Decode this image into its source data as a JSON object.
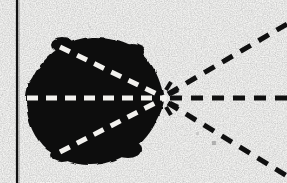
{
  "figure": {
    "kind": "scanned-line-drawing",
    "title": "Black blob with converging dashed axes and radiating dashed rays",
    "width": 287,
    "height": 183,
    "background_color": "#f7f7f5",
    "ink_color": "#0d0d0d",
    "dash_light_color": "#f2f1ee",
    "media": "photocopy / halftone scan",
    "noise": "light gray speckle on background"
  },
  "border_rule": {
    "name": "left vertical rule",
    "orientation": "vertical",
    "x": 17,
    "y_start": 0,
    "y_end": 183,
    "thickness": 2.2,
    "color": "#111111"
  },
  "blob": {
    "name": "solid black ovoid region",
    "fill_color": "#0d0d0d",
    "center_x": 92,
    "center_y": 100,
    "radius_x": 66,
    "radius_y": 63,
    "left_edge_x": 27,
    "right_tip_x": 166,
    "top_edge_y": 38,
    "bottom_edge_y": 165,
    "shape": "irregular ovoid, pointed at right vertex"
  },
  "vertex": {
    "name": "convergence point",
    "x": 164,
    "y": 98,
    "label": ""
  },
  "interior_dashes": {
    "color": "#f2f1ee",
    "dash_pattern": "11 8",
    "stroke_width": 5,
    "lines": [
      {
        "name": "interior-axis-upper",
        "x1": 60,
        "y1": 47,
        "x2": 163,
        "y2": 97
      },
      {
        "name": "interior-axis-middle",
        "x1": 27,
        "y1": 98,
        "x2": 163,
        "y2": 98
      },
      {
        "name": "interior-axis-lower",
        "x1": 60,
        "y1": 152,
        "x2": 163,
        "y2": 99
      }
    ]
  },
  "exterior_rays": {
    "color": "#101010",
    "dash_pattern": "12 9",
    "stroke_width": 5,
    "rays": [
      {
        "name": "ray-upper-right",
        "x1": 168,
        "y1": 94,
        "x2": 287,
        "y2": 24,
        "direction": "up-right"
      },
      {
        "name": "ray-horizontal-right",
        "x1": 170,
        "y1": 98,
        "x2": 287,
        "y2": 98,
        "direction": "right"
      },
      {
        "name": "ray-lower-right",
        "x1": 168,
        "y1": 103,
        "x2": 287,
        "y2": 176,
        "direction": "down-right"
      }
    ]
  },
  "vertex_ticks": {
    "name": "short radial ticks at vertex",
    "color": "#101010",
    "count": 4,
    "items": [
      {
        "name": "tick-up",
        "x1": 166,
        "y1": 90,
        "x2": 171,
        "y2": 82
      },
      {
        "name": "tick-up-inner",
        "x1": 170,
        "y1": 94,
        "x2": 178,
        "y2": 90
      },
      {
        "name": "tick-down-inner",
        "x1": 170,
        "y1": 103,
        "x2": 178,
        "y2": 107
      },
      {
        "name": "tick-down",
        "x1": 166,
        "y1": 107,
        "x2": 171,
        "y2": 115
      }
    ]
  }
}
